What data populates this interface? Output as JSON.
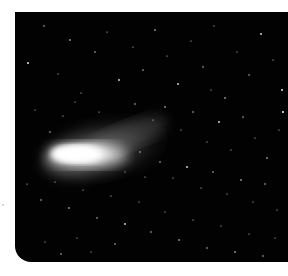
{
  "image": {
    "subject": "comet in star field",
    "description": "Black-and-white photograph of a comet with a bright white elongated coma on the left and a diffuse tail fanning to the upper right, set against a dense field of stars.",
    "colors": {
      "sky": "#020202",
      "comet_core": "#ffffff",
      "stars": "#e6e6e6",
      "margin": "#ffffff"
    }
  }
}
